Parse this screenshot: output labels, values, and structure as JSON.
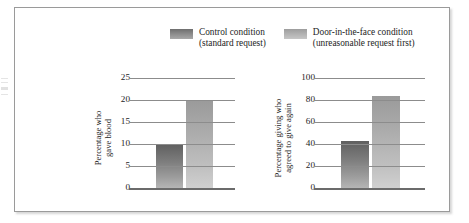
{
  "figure": {
    "legend": [
      {
        "key": "control",
        "swatch_name": "legend-swatch-control",
        "line1": "Control condition",
        "line2": "(standard request)",
        "color": "#7d7d7d"
      },
      {
        "key": "ditf",
        "swatch_name": "legend-swatch-door-in-the-face",
        "line1": "Door-in-the-face condition",
        "line2": "(unreasonable request first)",
        "color": "#b4b4b4"
      }
    ]
  },
  "chart_data": [
    {
      "type": "bar",
      "title": "",
      "xlabel": "",
      "ylabel": "Percentage who gave blood",
      "ylabel_lines": [
        "Percentage who",
        "gave blood"
      ],
      "categories": [
        "Control condition (standard request)",
        "Door-in-the-face condition (unreasonable request first)"
      ],
      "series": [
        {
          "name": "Percentage who gave blood",
          "values": [
            10,
            20
          ]
        }
      ],
      "ylim": [
        0,
        25
      ],
      "yticks": [
        0,
        5,
        10,
        15,
        20,
        25
      ],
      "ytick_labels": [
        "0",
        "5",
        "10",
        "15",
        "20",
        "25"
      ],
      "grid": true,
      "legend_position": "top-center",
      "bar_colors": [
        "#7d7d7d",
        "#b4b4b4"
      ]
    },
    {
      "type": "bar",
      "title": "",
      "xlabel": "",
      "ylabel": "Percentage giving who agreed to give again",
      "ylabel_lines": [
        "Percentage giving who",
        "agreed to give again"
      ],
      "categories": [
        "Control condition (standard request)",
        "Door-in-the-face condition (unreasonable request first)"
      ],
      "series": [
        {
          "name": "Percentage giving who agreed to give again",
          "values": [
            43,
            84
          ]
        }
      ],
      "ylim": [
        0,
        100
      ],
      "yticks": [
        0,
        20,
        40,
        60,
        80,
        100
      ],
      "ytick_labels": [
        "0",
        "20",
        "40",
        "60",
        "80",
        "100"
      ],
      "grid": true,
      "legend_position": "top-center",
      "bar_colors": [
        "#7d7d7d",
        "#b4b4b4"
      ]
    }
  ]
}
